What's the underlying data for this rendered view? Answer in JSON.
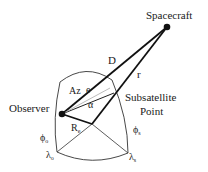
{
  "diagram": {
    "labels": {
      "spacecraft": "Spacecraft",
      "observer": "Observer",
      "subsatellite_line1": "Subsatellite",
      "subsatellite_line2": "Point",
      "D": "D",
      "r": "r",
      "Az": "Az",
      "e": "e",
      "alpha": "α",
      "Re_main": "R",
      "Re_sub": "e",
      "phi_o_main": "ϕ",
      "phi_o_sub": "o",
      "lambda_o_main": "λ",
      "lambda_o_sub": "o",
      "phi_s_main": "ϕ",
      "phi_s_sub": "s",
      "lambda_s_main": "λ",
      "lambda_s_sub": "s"
    },
    "colors": {
      "line": "#111111",
      "thin_line": "#333333",
      "gray_line": "#999999",
      "text": "#1a1a1a"
    }
  }
}
